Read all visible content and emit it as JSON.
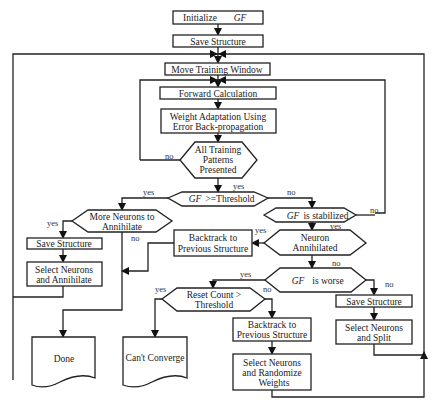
{
  "diagram": {
    "type": "flowchart",
    "nodes": {
      "init": {
        "text": "Initialize",
        "var": "GF"
      },
      "save1": {
        "text": "Save Structure"
      },
      "move": {
        "text": "Move Training Window"
      },
      "forward": {
        "text": "Forward Calculation"
      },
      "weight": {
        "line1": "Weight Adaptation Using",
        "line2": "Error Back-propagation"
      },
      "allpat": {
        "line1": "All Training",
        "line2": "Patterns",
        "line3": "Presented"
      },
      "gfthr": {
        "var": "GF",
        "text": ">=Threshold"
      },
      "moreneu": {
        "line1": "More Neurons to",
        "line2": "Annihilate"
      },
      "gfstab": {
        "var": "GF",
        "text": "is stabilized"
      },
      "save2": {
        "text": "Save Structure"
      },
      "selann": {
        "line1": "Select Neurons",
        "line2": "and Annihilate"
      },
      "back1": {
        "line1": "Backtrack to",
        "line2": "Previous Structure"
      },
      "neuann": {
        "line1": "Neuron",
        "line2": "Annihilated"
      },
      "gfworse": {
        "var": "GF",
        "text": "is worse"
      },
      "reset": {
        "line1": "Reset Count >",
        "line2": "Threshold"
      },
      "save3": {
        "text": "Save Structure"
      },
      "back2": {
        "line1": "Backtrack to",
        "line2": "Previous Structure"
      },
      "selsplit": {
        "line1": "Select Neurons",
        "line2": "and Split"
      },
      "done": {
        "text": "Done"
      },
      "cantconv": {
        "text": "Can't Converge"
      },
      "selrand": {
        "line1": "Select Neurons",
        "line2": "and Randomize",
        "line3": "Weights"
      }
    },
    "edge_labels": {
      "allpat_no": "no",
      "allpat_yes": "yes",
      "gfthr_yes": "yes",
      "gfthr_no": "no",
      "moreneu_yes": "yes",
      "moreneu_no": "no",
      "gfstab_no": "no",
      "gfstab_yes": "yes",
      "neuann_yes": "yes",
      "neuann_no": "no",
      "gfworse_yes": "yes",
      "gfworse_no": "no",
      "reset_yes": "yes",
      "reset_no": "no"
    }
  }
}
